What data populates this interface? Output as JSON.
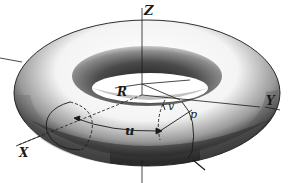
{
  "figure": {
    "labels": {
      "z_axis": "Z",
      "y_axis": "Y",
      "x_axis": "X",
      "major_radius": "R",
      "angle_u": "u",
      "angle_v": "v",
      "point": "p"
    },
    "colors": {
      "ink": "#1a1a1a",
      "background": "#ffffff",
      "shade_dark": "#2b2b2b",
      "shade_mid": "#7a7a7a",
      "shade_light": "#d8d8d8"
    }
  }
}
